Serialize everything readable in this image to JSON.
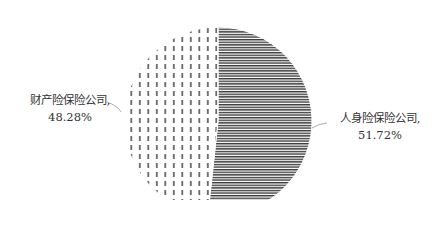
{
  "chart_data": {
    "type": "pie",
    "title": "",
    "slices": [
      {
        "label": "人身险保险公司",
        "value": 51.72,
        "display": "51.72%",
        "pattern": "horizontal-lines",
        "color": "#3a3a3a"
      },
      {
        "label": "财产险保险公司",
        "value": 48.28,
        "display": "48.28%",
        "pattern": "vertical-dashes",
        "color": "#555555"
      }
    ],
    "legend": "none",
    "start_angle": "12 o'clock, clockwise"
  },
  "labels": {
    "left": {
      "name": "财产险保险公司,",
      "value": "48.28%"
    },
    "right": {
      "name": "人身险保险公司,",
      "value": "51.72%"
    }
  }
}
